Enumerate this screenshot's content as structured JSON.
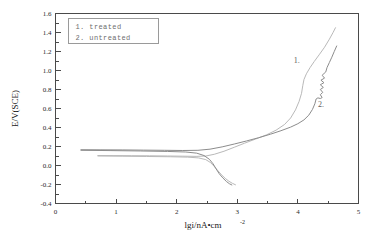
{
  "chart_data": {
    "type": "line",
    "title": "",
    "xlabel": "lgi/nA•cm",
    "xlabel_exponent": "-2",
    "ylabel": "E/V(SCE)",
    "xlim": [
      0,
      5
    ],
    "ylim": [
      -0.4,
      1.6
    ],
    "xticks": [
      "0",
      "1",
      "2",
      "3",
      "4",
      "5"
    ],
    "xtick_values": [
      0,
      1,
      2,
      3,
      4,
      5
    ],
    "xtick_minor_values": [
      0.5,
      1.5,
      2.5,
      3.5,
      4.5
    ],
    "yticks": [
      "-0.4",
      "-0.2",
      "0.0",
      "0.2",
      "0.4",
      "0.6",
      "0.8",
      "1.0",
      "1.2",
      "1.4",
      "1.6"
    ],
    "ytick_values": [
      -0.4,
      -0.2,
      0.0,
      0.2,
      0.4,
      0.6,
      0.8,
      1.0,
      1.2,
      1.4,
      1.6
    ],
    "ytick_minor_values": [
      -0.3,
      -0.1,
      0.1,
      0.3,
      0.5,
      0.7,
      0.9,
      1.1,
      1.3,
      1.5
    ],
    "grid": false,
    "legend_position": "upper-left",
    "series": [
      {
        "name": "1. treated",
        "key": "treated",
        "color": "#b9b9b9",
        "label_marker": "1.",
        "anodic_points": [
          [
            0.7,
            0.105
          ],
          [
            0.95,
            0.104
          ],
          [
            1.25,
            0.103
          ],
          [
            1.55,
            0.102
          ],
          [
            1.85,
            0.1
          ],
          [
            2.1,
            0.098
          ],
          [
            2.32,
            0.096
          ],
          [
            2.48,
            0.1
          ],
          [
            2.62,
            0.118
          ],
          [
            2.78,
            0.15
          ],
          [
            2.95,
            0.192
          ],
          [
            3.12,
            0.235
          ],
          [
            3.3,
            0.278
          ],
          [
            3.48,
            0.322
          ],
          [
            3.64,
            0.372
          ],
          [
            3.78,
            0.432
          ],
          [
            3.88,
            0.5
          ],
          [
            3.96,
            0.585
          ],
          [
            4.02,
            0.675
          ],
          [
            4.06,
            0.76
          ],
          [
            4.08,
            0.84
          ],
          [
            4.1,
            0.905
          ],
          [
            4.14,
            0.965
          ],
          [
            4.2,
            1.03
          ],
          [
            4.27,
            1.095
          ],
          [
            4.35,
            1.165
          ],
          [
            4.44,
            1.245
          ],
          [
            4.52,
            1.33
          ],
          [
            4.58,
            1.4
          ],
          [
            4.62,
            1.45
          ]
        ],
        "cathodic_points": [
          [
            0.7,
            0.1
          ],
          [
            1.1,
            0.098
          ],
          [
            1.5,
            0.095
          ],
          [
            1.9,
            0.092
          ],
          [
            2.18,
            0.088
          ],
          [
            2.36,
            0.08
          ],
          [
            2.48,
            0.062
          ],
          [
            2.56,
            0.03
          ],
          [
            2.62,
            -0.01
          ],
          [
            2.68,
            -0.055
          ],
          [
            2.74,
            -0.098
          ],
          [
            2.8,
            -0.135
          ],
          [
            2.86,
            -0.165
          ],
          [
            2.92,
            -0.188
          ],
          [
            2.97,
            -0.203
          ]
        ]
      },
      {
        "name": "2. untreated",
        "key": "untreated",
        "color": "#8c8c8c",
        "label_marker": "2.",
        "anodic_points": [
          [
            0.42,
            0.166
          ],
          [
            0.75,
            0.165
          ],
          [
            1.1,
            0.164
          ],
          [
            1.45,
            0.162
          ],
          [
            1.8,
            0.16
          ],
          [
            2.1,
            0.158
          ],
          [
            2.35,
            0.16
          ],
          [
            2.55,
            0.172
          ],
          [
            2.75,
            0.196
          ],
          [
            2.95,
            0.226
          ],
          [
            3.15,
            0.258
          ],
          [
            3.35,
            0.292
          ],
          [
            3.55,
            0.33
          ],
          [
            3.72,
            0.366
          ],
          [
            3.88,
            0.404
          ],
          [
            4.0,
            0.44
          ],
          [
            4.1,
            0.48
          ],
          [
            4.18,
            0.53
          ],
          [
            4.24,
            0.59
          ],
          [
            4.28,
            0.65
          ],
          [
            4.3,
            0.7
          ],
          [
            4.33,
            0.712
          ],
          [
            4.37,
            0.705
          ],
          [
            4.4,
            0.715
          ],
          [
            4.37,
            0.745
          ],
          [
            4.41,
            0.77
          ],
          [
            4.37,
            0.8
          ],
          [
            4.42,
            0.822
          ],
          [
            4.37,
            0.85
          ],
          [
            4.43,
            0.872
          ],
          [
            4.38,
            0.898
          ],
          [
            4.44,
            0.92
          ],
          [
            4.4,
            0.95
          ],
          [
            4.46,
            0.985
          ],
          [
            4.48,
            1.03
          ],
          [
            4.52,
            1.085
          ],
          [
            4.56,
            1.14
          ],
          [
            4.6,
            1.2
          ],
          [
            4.64,
            1.258
          ]
        ],
        "cathodic_points": [
          [
            0.42,
            0.16
          ],
          [
            0.9,
            0.157
          ],
          [
            1.4,
            0.153
          ],
          [
            1.85,
            0.148
          ],
          [
            2.15,
            0.142
          ],
          [
            2.33,
            0.13
          ],
          [
            2.45,
            0.105
          ],
          [
            2.54,
            0.065
          ],
          [
            2.6,
            0.018
          ],
          [
            2.65,
            -0.035
          ],
          [
            2.7,
            -0.085
          ],
          [
            2.76,
            -0.13
          ],
          [
            2.82,
            -0.168
          ],
          [
            2.87,
            -0.192
          ],
          [
            2.91,
            -0.205
          ]
        ]
      }
    ],
    "annotations": [
      {
        "text": "1.",
        "x": 3.93,
        "y": 1.075
      },
      {
        "text": "2.",
        "x": 4.33,
        "y": 0.615
      }
    ],
    "legend": {
      "entries": [
        "1.  treated",
        "2.  untreated"
      ]
    }
  }
}
